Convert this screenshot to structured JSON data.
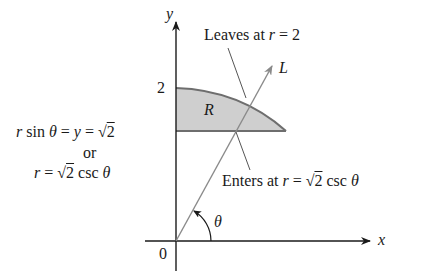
{
  "figure": {
    "axes": {
      "x_label": "x",
      "y_label": "y",
      "origin_label": "0",
      "y_tick_2": "2"
    },
    "region_label": "R",
    "ray_label": "L",
    "angle_label": "θ",
    "annotations": {
      "leaves": {
        "prefix": "Leaves at ",
        "var": "r",
        "rest": " = 2"
      },
      "enters": {
        "prefix": "Enters at ",
        "var": "r",
        "eq": " = ",
        "sqrt_sym": "√",
        "sqrt_arg": "2",
        "rest": " csc ",
        "theta": "θ"
      },
      "line_eq1": {
        "r": "r",
        "sin": " sin ",
        "theta": "θ",
        "eq": " = ",
        "y": "y",
        "eq2": " = ",
        "sqrt_sym": "√",
        "sqrt_arg": "2"
      },
      "or": "or",
      "line_eq2": {
        "r": "r",
        "eq": " = ",
        "sqrt_sym": "√",
        "sqrt_arg": "2",
        "rest": " csc ",
        "theta": "θ"
      }
    },
    "colors": {
      "axis": "#1a1a1a",
      "region_fill": "#cfcfcf",
      "region_stroke": "#6e6e6e",
      "ray": "#8a8a8a",
      "leader": "#555555"
    }
  }
}
